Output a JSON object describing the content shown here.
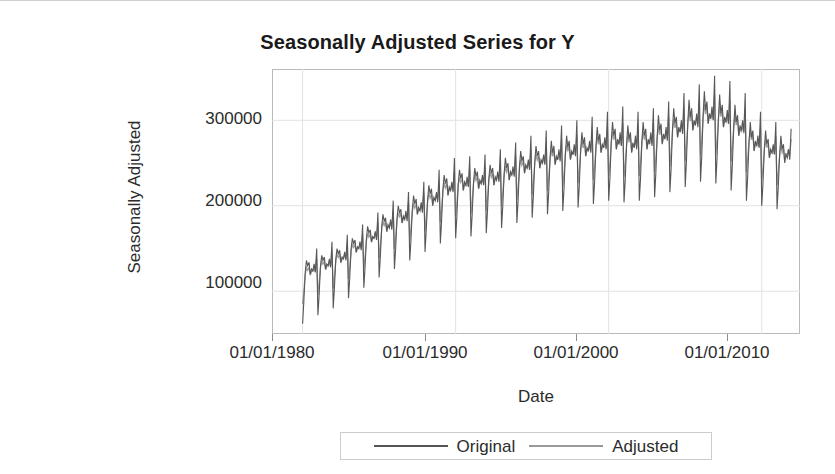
{
  "chart_data": {
    "type": "line",
    "title": "Seasonally Adjusted Series for Y",
    "xlabel": "Date",
    "ylabel": "Seasonally Adjusted",
    "grid": true,
    "legend_position": "bottom",
    "xlim": [
      "01/01/1978",
      "01/01/2012"
    ],
    "ylim": [
      50000,
      360000
    ],
    "xtick_labels": [
      "01/01/1980",
      "01/01/1990",
      "01/01/2000",
      "01/01/2010"
    ],
    "xtick_values": [
      1980,
      1990,
      2000,
      2010
    ],
    "ytick_labels": [
      "100000",
      "200000",
      "300000"
    ],
    "ytick_values": [
      100000,
      200000,
      300000
    ],
    "colors": {
      "original": "#555555",
      "adjusted": "#999999",
      "frame": "#b9b9b9",
      "grid": "#e2e2e2",
      "text": "#2b2b2b"
    },
    "series": [
      {
        "name": "Original",
        "color": "#555555",
        "x": [
          1980.0,
          1980.08,
          1980.17,
          1980.25,
          1980.33,
          1980.42,
          1980.5,
          1980.58,
          1980.67,
          1980.75,
          1980.83,
          1980.92,
          1981.0,
          1981.08,
          1981.17,
          1981.25,
          1981.33,
          1981.42,
          1981.5,
          1981.58,
          1981.67,
          1981.75,
          1981.83,
          1981.92,
          1982.0,
          1982.08,
          1982.17,
          1982.25,
          1982.33,
          1982.42,
          1982.5,
          1982.58,
          1982.67,
          1982.75,
          1982.83,
          1982.92,
          1983.0,
          1983.08,
          1983.17,
          1983.25,
          1983.33,
          1983.42,
          1983.5,
          1983.58,
          1983.67,
          1983.75,
          1983.83,
          1983.92,
          1984.0,
          1984.08,
          1984.17,
          1984.25,
          1984.33,
          1984.42,
          1984.5,
          1984.58,
          1984.67,
          1984.75,
          1984.83,
          1984.92,
          1985.0,
          1985.08,
          1985.17,
          1985.25,
          1985.33,
          1985.42,
          1985.5,
          1985.58,
          1985.67,
          1985.75,
          1985.83,
          1985.92,
          1986.0,
          1986.08,
          1986.17,
          1986.25,
          1986.33,
          1986.42,
          1986.5,
          1986.58,
          1986.67,
          1986.75,
          1986.83,
          1986.92,
          1987.0,
          1987.08,
          1987.17,
          1987.25,
          1987.33,
          1987.42,
          1987.5,
          1987.58,
          1987.67,
          1987.75,
          1987.83,
          1987.92,
          1988.0,
          1988.08,
          1988.17,
          1988.25,
          1988.33,
          1988.42,
          1988.5,
          1988.58,
          1988.67,
          1988.75,
          1988.83,
          1988.92,
          1989.0,
          1989.08,
          1989.17,
          1989.25,
          1989.33,
          1989.42,
          1989.5,
          1989.58,
          1989.67,
          1989.75,
          1989.83,
          1989.92,
          1990.0,
          1990.08,
          1990.17,
          1990.25,
          1990.33,
          1990.42,
          1990.5,
          1990.58,
          1990.67,
          1990.75,
          1990.83,
          1990.92,
          1991.0,
          1991.08,
          1991.17,
          1991.25,
          1991.33,
          1991.42,
          1991.5,
          1991.58,
          1991.67,
          1991.75,
          1991.83,
          1991.92,
          1992.0,
          1992.08,
          1992.17,
          1992.25,
          1992.33,
          1992.42,
          1992.5,
          1992.58,
          1992.67,
          1992.75,
          1992.83,
          1992.92,
          1993.0,
          1993.08,
          1993.17,
          1993.25,
          1993.33,
          1993.42,
          1993.5,
          1993.58,
          1993.67,
          1993.75,
          1993.83,
          1993.92,
          1994.0,
          1994.08,
          1994.17,
          1994.25,
          1994.33,
          1994.42,
          1994.5,
          1994.58,
          1994.67,
          1994.75,
          1994.83,
          1994.92,
          1995.0,
          1995.08,
          1995.17,
          1995.25,
          1995.33,
          1995.42,
          1995.5,
          1995.58,
          1995.67,
          1995.75,
          1995.83,
          1995.92,
          1996.0,
          1996.08,
          1996.17,
          1996.25,
          1996.33,
          1996.42,
          1996.5,
          1996.58,
          1996.67,
          1996.75,
          1996.83,
          1996.92,
          1997.0,
          1997.08,
          1997.17,
          1997.25,
          1997.33,
          1997.42,
          1997.5,
          1997.58,
          1997.67,
          1997.75,
          1997.83,
          1997.92,
          1998.0,
          1998.08,
          1998.17,
          1998.25,
          1998.33,
          1998.42,
          1998.5,
          1998.58,
          1998.67,
          1998.75,
          1998.83,
          1998.92,
          1999.0,
          1999.08,
          1999.17,
          1999.25,
          1999.33,
          1999.42,
          1999.5,
          1999.58,
          1999.67,
          1999.75,
          1999.83,
          1999.92,
          2000.0,
          2000.08,
          2000.17,
          2000.25,
          2000.33,
          2000.42,
          2000.5,
          2000.58,
          2000.67,
          2000.75,
          2000.83,
          2000.92,
          2001.0,
          2001.08,
          2001.17,
          2001.25,
          2001.33,
          2001.42,
          2001.5,
          2001.58,
          2001.67,
          2001.75,
          2001.83,
          2001.92,
          2002.0,
          2002.08,
          2002.17,
          2002.25,
          2002.33,
          2002.42,
          2002.5,
          2002.58,
          2002.67,
          2002.75,
          2002.83,
          2002.92,
          2003.0,
          2003.08,
          2003.17,
          2003.25,
          2003.33,
          2003.42,
          2003.5,
          2003.58,
          2003.67,
          2003.75,
          2003.83,
          2003.92,
          2004.0,
          2004.08,
          2004.17,
          2004.25,
          2004.33,
          2004.42,
          2004.5,
          2004.58,
          2004.67,
          2004.75,
          2004.83,
          2004.92,
          2005.0,
          2005.08,
          2005.17,
          2005.25,
          2005.33,
          2005.42,
          2005.5,
          2005.58,
          2005.67,
          2005.75,
          2005.83,
          2005.92,
          2006.0,
          2006.08,
          2006.17,
          2006.25,
          2006.33,
          2006.42,
          2006.5,
          2006.58,
          2006.67,
          2006.75,
          2006.83,
          2006.92,
          2007.0,
          2007.08,
          2007.17,
          2007.25,
          2007.33,
          2007.42,
          2007.5,
          2007.58,
          2007.67,
          2007.75,
          2007.83,
          2007.92,
          2008.0,
          2008.08,
          2008.17,
          2008.25,
          2008.33,
          2008.42,
          2008.5,
          2008.58,
          2008.67,
          2008.75,
          2008.83,
          2008.92,
          2009.0,
          2009.08,
          2009.17,
          2009.25,
          2009.33,
          2009.42,
          2009.5,
          2009.58,
          2009.67,
          2009.75,
          2009.83,
          2009.92,
          2010.0,
          2010.08,
          2010.17,
          2010.25,
          2010.33,
          2010.42,
          2010.5,
          2010.58,
          2010.67,
          2010.75,
          2010.83,
          2010.92,
          2011.0,
          2011.08,
          2011.17,
          2011.25,
          2011.33,
          2011.42,
          2011.5,
          2011.58,
          2011.67,
          2011.75,
          2011.83,
          2011.92
        ],
        "y": [
          62000,
          88000,
          122000,
          136000,
          130000,
          134000,
          120000,
          126000,
          124000,
          132000,
          122000,
          150000,
          72000,
          96000,
          130000,
          142000,
          136000,
          140000,
          126000,
          132000,
          130000,
          138000,
          128000,
          158000,
          80000,
          104000,
          138000,
          150000,
          144000,
          148000,
          134000,
          140000,
          138000,
          146000,
          136000,
          166000,
          92000,
          116000,
          150000,
          162000,
          156000,
          160000,
          146000,
          152000,
          150000,
          158000,
          148000,
          178000,
          104000,
          128000,
          162000,
          176000,
          168000,
          172000,
          158000,
          164000,
          162000,
          170000,
          160000,
          192000,
          116000,
          140000,
          176000,
          190000,
          182000,
          186000,
          170000,
          178000,
          174000,
          184000,
          172000,
          206000,
          126000,
          150000,
          186000,
          200000,
          192000,
          196000,
          180000,
          188000,
          184000,
          194000,
          182000,
          216000,
          136000,
          160000,
          196000,
          212000,
          202000,
          208000,
          190000,
          198000,
          194000,
          204000,
          192000,
          228000,
          146000,
          172000,
          208000,
          224000,
          214000,
          220000,
          200000,
          210000,
          206000,
          216000,
          204000,
          242000,
          156000,
          182000,
          220000,
          236000,
          226000,
          232000,
          212000,
          222000,
          218000,
          228000,
          216000,
          256000,
          162000,
          188000,
          226000,
          242000,
          232000,
          238000,
          218000,
          228000,
          224000,
          234000,
          222000,
          258000,
          164000,
          190000,
          228000,
          244000,
          234000,
          240000,
          220000,
          230000,
          226000,
          236000,
          224000,
          260000,
          168000,
          194000,
          232000,
          248000,
          238000,
          244000,
          224000,
          234000,
          230000,
          240000,
          228000,
          266000,
          174000,
          200000,
          238000,
          256000,
          244000,
          250000,
          230000,
          240000,
          236000,
          246000,
          234000,
          274000,
          180000,
          206000,
          246000,
          264000,
          252000,
          258000,
          238000,
          248000,
          244000,
          254000,
          242000,
          282000,
          186000,
          212000,
          252000,
          270000,
          258000,
          264000,
          244000,
          254000,
          250000,
          260000,
          248000,
          288000,
          190000,
          216000,
          256000,
          276000,
          262000,
          270000,
          248000,
          258000,
          254000,
          266000,
          252000,
          294000,
          194000,
          220000,
          262000,
          282000,
          268000,
          276000,
          254000,
          264000,
          260000,
          272000,
          258000,
          300000,
          198000,
          224000,
          266000,
          286000,
          272000,
          280000,
          258000,
          268000,
          264000,
          276000,
          262000,
          304000,
          202000,
          228000,
          270000,
          292000,
          276000,
          284000,
          262000,
          272000,
          268000,
          280000,
          266000,
          310000,
          206000,
          232000,
          276000,
          298000,
          282000,
          290000,
          266000,
          278000,
          272000,
          286000,
          270000,
          316000,
          204000,
          230000,
          272000,
          294000,
          278000,
          286000,
          262000,
          274000,
          268000,
          282000,
          266000,
          310000,
          206000,
          232000,
          276000,
          298000,
          282000,
          290000,
          266000,
          278000,
          272000,
          286000,
          270000,
          314000,
          210000,
          238000,
          282000,
          306000,
          288000,
          296000,
          272000,
          284000,
          278000,
          292000,
          276000,
          322000,
          216000,
          244000,
          290000,
          314000,
          296000,
          304000,
          280000,
          292000,
          286000,
          300000,
          284000,
          332000,
          222000,
          252000,
          298000,
          324000,
          304000,
          314000,
          288000,
          300000,
          294000,
          308000,
          292000,
          342000,
          228000,
          258000,
          306000,
          334000,
          312000,
          322000,
          296000,
          308000,
          302000,
          316000,
          300000,
          352000,
          226000,
          256000,
          302000,
          330000,
          308000,
          318000,
          292000,
          304000,
          298000,
          312000,
          296000,
          346000,
          218000,
          248000,
          292000,
          318000,
          298000,
          306000,
          282000,
          294000,
          288000,
          300000,
          286000,
          332000,
          206000,
          234000,
          274000,
          298000,
          280000,
          288000,
          264000,
          276000,
          270000,
          282000,
          268000,
          310000,
          200000,
          226000,
          266000,
          288000,
          272000,
          278000,
          256000,
          266000,
          262000,
          272000,
          260000,
          298000,
          196000,
          222000,
          260000,
          282000,
          266000,
          272000,
          250000,
          260000,
          256000,
          266000,
          254000,
          290000
        ]
      },
      {
        "name": "Adjusted",
        "color": "#999999",
        "note": "Seasonally adjusted version of the Original series; smoother trend with reduced monthly amplitude, closely overlapping the Original line.",
        "x_same_as": "Original",
        "amplitude_damping": 0.55
      }
    ]
  },
  "chart": {
    "title": "Seasonally Adjusted Series for Y",
    "x_axis_title": "Date",
    "y_axis_title": "Seasonally Adjusted",
    "x_ticks": [
      "01/01/1980",
      "01/01/1990",
      "01/01/2000",
      "01/01/2010"
    ],
    "y_ticks": [
      "300000",
      "200000",
      "100000"
    ],
    "legend": [
      {
        "label": "Original",
        "color": "#555555",
        "style": "solid"
      },
      {
        "label": "Adjusted",
        "color": "#999999",
        "style": "solid"
      }
    ]
  }
}
